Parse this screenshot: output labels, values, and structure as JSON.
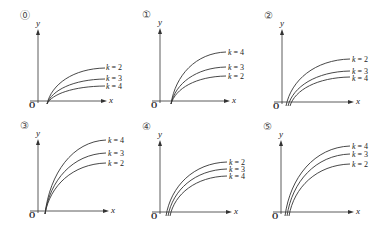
{
  "figure": {
    "panels": [
      {
        "id": "0",
        "marker": "⓪",
        "x_axis_label": "x",
        "y_axis_label": "y",
        "origin_label": "O",
        "origin": [
          38,
          101
        ],
        "x_axis_end": 103,
        "y_axis_top": 33,
        "curves": [
          {
            "k": "k = 2",
            "start": [
              47,
              104
            ],
            "end": [
              105,
              68
            ],
            "label_pos": [
              106,
              64
            ]
          },
          {
            "k": "k = 3",
            "start": [
              47,
              104
            ],
            "end": [
              105,
              79
            ],
            "label_pos": [
              106,
              75
            ]
          },
          {
            "k": "k = 4",
            "start": [
              47,
              104
            ],
            "end": [
              105,
              86
            ],
            "label_pos": [
              106,
              83
            ]
          }
        ]
      },
      {
        "id": "1",
        "marker": "①",
        "x_axis_label": "x",
        "y_axis_label": "y",
        "origin_label": "O",
        "origin": [
          160,
          101
        ],
        "x_axis_end": 226,
        "y_axis_top": 32,
        "curves": [
          {
            "k": "k = 4",
            "start": [
              171,
              104
            ],
            "end": [
              226,
              52
            ],
            "label_pos": [
              228,
              49
            ]
          },
          {
            "k": "k = 3",
            "start": [
              171,
              104
            ],
            "end": [
              226,
              67
            ],
            "label_pos": [
              228,
              64
            ]
          },
          {
            "k": "k = 2",
            "start": [
              171,
              104
            ],
            "end": [
              226,
              76
            ],
            "label_pos": [
              228,
              73
            ]
          }
        ]
      },
      {
        "id": "2",
        "marker": "②",
        "x_axis_label": "x",
        "y_axis_label": "y",
        "origin_label": "O",
        "origin": [
          282,
          102
        ],
        "x_axis_end": 350,
        "y_axis_top": 33,
        "curves": [
          {
            "k": "k = 2",
            "start": [
              286,
              106
            ],
            "end": [
              350,
              59
            ],
            "label_pos": [
              352,
              56
            ]
          },
          {
            "k": "k = 3",
            "start": [
              288,
              106
            ],
            "end": [
              350,
              71
            ],
            "label_pos": [
              352,
              68
            ]
          },
          {
            "k": "k = 4",
            "start": [
              290,
              106
            ],
            "end": [
              350,
              77
            ],
            "label_pos": [
              352,
              75
            ]
          }
        ]
      },
      {
        "id": "3",
        "marker": "③",
        "x_axis_label": "x",
        "y_axis_label": "y",
        "origin_label": "O",
        "origin": [
          38,
          211
        ],
        "x_axis_end": 105,
        "y_axis_top": 143,
        "curves": [
          {
            "k": "k = 4",
            "start": [
              45,
              214
            ],
            "end": [
              106,
              140
            ],
            "label_pos": [
              108,
              137
            ]
          },
          {
            "k": "k = 3",
            "start": [
              45,
              214
            ],
            "end": [
              106,
              153
            ],
            "label_pos": [
              108,
              150
            ]
          },
          {
            "k": "k = 2",
            "start": [
              45,
              214
            ],
            "end": [
              106,
              163
            ],
            "label_pos": [
              108,
              160
            ]
          }
        ]
      },
      {
        "id": "4",
        "marker": "④",
        "x_axis_label": "x",
        "y_axis_label": "y",
        "origin_label": "O",
        "origin": [
          160,
          212
        ],
        "x_axis_end": 228,
        "y_axis_top": 144,
        "curves": [
          {
            "k": "k = 2",
            "start": [
              166,
              216
            ],
            "end": [
              227,
              162
            ],
            "label_pos": [
              229,
              159
            ]
          },
          {
            "k": "k = 3",
            "start": [
              168,
              216
            ],
            "end": [
              227,
              169
            ],
            "label_pos": [
              229,
              166
            ]
          },
          {
            "k": "k = 4",
            "start": [
              170,
              216
            ],
            "end": [
              227,
              176
            ],
            "label_pos": [
              229,
              173
            ]
          }
        ]
      },
      {
        "id": "5",
        "marker": "⑤",
        "x_axis_label": "x",
        "y_axis_label": "y",
        "origin_label": "O",
        "origin": [
          281,
          212
        ],
        "x_axis_end": 350,
        "y_axis_top": 144,
        "curves": [
          {
            "k": "k = 4",
            "start": [
              285,
              216
            ],
            "end": [
              350,
              146
            ],
            "label_pos": [
              352,
              143
            ]
          },
          {
            "k": "k = 3",
            "start": [
              287,
              216
            ],
            "end": [
              350,
              154
            ],
            "label_pos": [
              352,
              151
            ]
          },
          {
            "k": "k = 2",
            "start": [
              289,
              216
            ],
            "end": [
              350,
              164
            ],
            "label_pos": [
              352,
              161
            ]
          }
        ]
      }
    ]
  },
  "colors": {
    "line": "#333333",
    "text": "#222222",
    "marker": "#555555"
  }
}
